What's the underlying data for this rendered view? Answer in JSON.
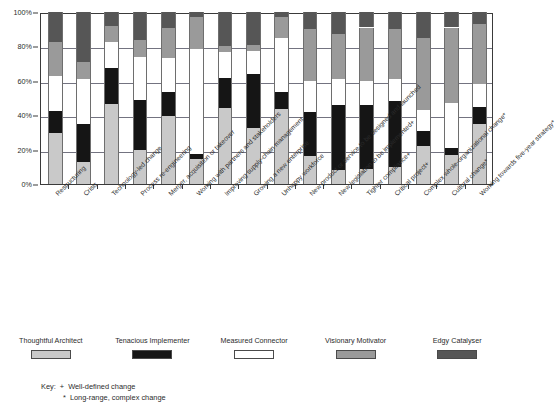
{
  "chart_data": {
    "type": "bar",
    "subtype": "100% stacked column",
    "title": "",
    "xlabel": "",
    "ylabel": "",
    "ylim": [
      0,
      100
    ],
    "yticks": [
      0,
      20,
      40,
      60,
      80,
      100
    ],
    "ytick_labels": [
      "0%",
      "20%",
      "40%",
      "60%",
      "80%",
      "100%"
    ],
    "grid": true,
    "legend_position": "bottom",
    "categories": [
      "Restructuring",
      "Crisis",
      "Technology-led change",
      "Process re-engineering",
      "Merger, acquisition or takeover",
      "Working with partners and stakeholders",
      "Improving supply-chain management",
      "Growing a new enterprise",
      "Unhappy workforce",
      "New product or service to be designed and launched",
      "New legislation to be implemented+",
      "Tighter compliance+",
      "Critical project+",
      "Complex whole-organizational change*",
      "Cultural change*",
      "Working towards five-year strategy*"
    ],
    "series": [
      {
        "name": "Thoughtful Architect",
        "color": "#c9c9c9",
        "values": [
          34,
          13,
          59,
          20,
          50,
          15,
          52,
          38,
          43,
          16,
          8,
          9,
          10,
          22,
          17,
          35
        ]
      },
      {
        "name": "Tenacious Implementer",
        "color": "#151515",
        "values": [
          15,
          22,
          27,
          29,
          18,
          3,
          20,
          36,
          10,
          26,
          38,
          37,
          38,
          9,
          4,
          10
        ]
      },
      {
        "name": "Measured Connector",
        "color": "#ffffff",
        "values": [
          23,
          26,
          19,
          25,
          25,
          62,
          18,
          16,
          31,
          18,
          15,
          14,
          13,
          12,
          26,
          13
        ]
      },
      {
        "name": "Visionary Motivator",
        "color": "#9a9a9a",
        "values": [
          23,
          10,
          12,
          10,
          22,
          19,
          4,
          4,
          12,
          30,
          26,
          31,
          29,
          42,
          44,
          35
        ]
      },
      {
        "name": "Edgy Catalyser",
        "color": "#565656",
        "values": [
          20,
          29,
          10,
          16,
          12,
          3,
          23,
          22,
          3,
          10,
          13,
          9,
          10,
          15,
          9,
          7
        ]
      }
    ]
  },
  "legend": {
    "items": [
      {
        "label": "Thoughtful Architect",
        "swatch": "s0"
      },
      {
        "label": "Tenacious Implementer",
        "swatch": "s1"
      },
      {
        "label": "Measured Connector",
        "swatch": "s2"
      },
      {
        "label": "Visionary Motivator",
        "swatch": "s3"
      },
      {
        "label": "Edgy Catalyser",
        "swatch": "s4"
      }
    ]
  },
  "key": {
    "title": "Key:",
    "entries": [
      {
        "symbol": "+",
        "text": "Well-defined change"
      },
      {
        "symbol": "*",
        "text": "Long-range, complex change"
      }
    ]
  }
}
